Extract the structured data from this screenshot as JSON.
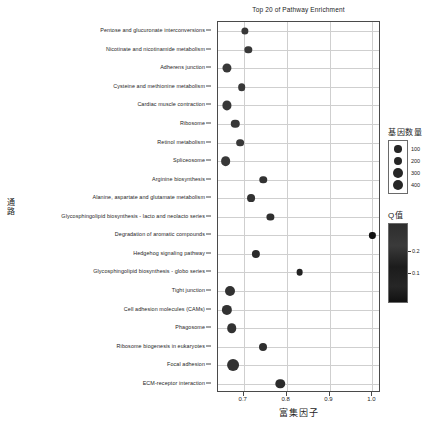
{
  "chart_data": {
    "type": "scatter",
    "title": "Top 20 of Pathway Enrichment",
    "xlabel": "富集因子",
    "ylabel": "通路",
    "xlim": [
      0.64,
      1.02
    ],
    "ylim": [
      0,
      21
    ],
    "grid": true,
    "xticks": [
      0.7,
      0.8,
      0.9,
      1.0
    ],
    "xtick_labels": [
      "0.7",
      "0.8",
      "0.9",
      "1.0"
    ],
    "categories": [
      "Pentose and glucuronate interconversions",
      "Nicotinate and nicotinamide metabolism",
      "Adherens junction",
      "Cysteine and methionine metabolism",
      "Cardiac muscle contraction",
      "Ribosome",
      "Retinol metabolism",
      "Spliceosome",
      "Arginine biosynthesis",
      "Alanine, aspartate and glutamate metabolism",
      "Glycosphingolipid biosynthesis - lacto and neolacto series",
      "Degradation of aromatic compounds",
      "Hedgehog signaling pathway",
      "Glycosphingolipid biosynthesis - globo series",
      "Tight junction",
      "Cell adhesion molecules (CAMs)",
      "Phagosome",
      "Ribosome biogenesis in eukaryotes",
      "Focal adhesion",
      "ECM-receptor interaction"
    ],
    "points": [
      {
        "pathway": "Pentose and glucuronate interconversions",
        "x": 0.702,
        "gene_number": 70,
        "qvalue": 0.02
      },
      {
        "pathway": "Nicotinate and nicotinamide metabolism",
        "x": 0.711,
        "gene_number": 75,
        "qvalue": 0.02
      },
      {
        "pathway": "Adherens junction",
        "x": 0.661,
        "gene_number": 150,
        "qvalue": 0.02
      },
      {
        "pathway": "Cysteine and methionine metabolism",
        "x": 0.695,
        "gene_number": 85,
        "qvalue": 0.02
      },
      {
        "pathway": "Cardiac muscle contraction",
        "x": 0.661,
        "gene_number": 155,
        "qvalue": 0.02
      },
      {
        "pathway": "Ribosome",
        "x": 0.68,
        "gene_number": 120,
        "qvalue": 0.02
      },
      {
        "pathway": "Retinol metabolism",
        "x": 0.692,
        "gene_number": 90,
        "qvalue": 0.02
      },
      {
        "pathway": "Spliceosome",
        "x": 0.658,
        "gene_number": 185,
        "qvalue": 0.02
      },
      {
        "pathway": "Arginine biosynthesis",
        "x": 0.745,
        "gene_number": 80,
        "qvalue": 0.05
      },
      {
        "pathway": "Alanine, aspartate and glutamate metabolism",
        "x": 0.718,
        "gene_number": 95,
        "qvalue": 0.05
      },
      {
        "pathway": "Glycosphingolipid biosynthesis - lacto and neolacto series",
        "x": 0.762,
        "gene_number": 70,
        "qvalue": 0.07
      },
      {
        "pathway": "Degradation of aromatic compounds",
        "x": 1.0,
        "gene_number": 40,
        "qvalue": 0.22
      },
      {
        "pathway": "Hedgehog signaling pathway",
        "x": 0.728,
        "gene_number": 110,
        "qvalue": 0.09
      },
      {
        "pathway": "Glycosphingolipid biosynthesis - globo series",
        "x": 0.83,
        "gene_number": 55,
        "qvalue": 0.13
      },
      {
        "pathway": "Tight junction",
        "x": 0.667,
        "gene_number": 200,
        "qvalue": 0.05
      },
      {
        "pathway": "Cell adhesion molecules (CAMs)",
        "x": 0.661,
        "gene_number": 215,
        "qvalue": 0.05
      },
      {
        "pathway": "Phagosome",
        "x": 0.672,
        "gene_number": 175,
        "qvalue": 0.05
      },
      {
        "pathway": "Ribosome biogenesis in eukaryotes",
        "x": 0.745,
        "gene_number": 100,
        "qvalue": 0.07
      },
      {
        "pathway": "Focal adhesion",
        "x": 0.675,
        "gene_number": 330,
        "qvalue": 0.05
      },
      {
        "pathway": "ECM-receptor interaction",
        "x": 0.785,
        "gene_number": 170,
        "qvalue": 0.09
      }
    ],
    "legends": {
      "size": {
        "title": "基因数量",
        "values": [
          100,
          200,
          300,
          400
        ],
        "labels": [
          "100",
          "200",
          "300",
          "400"
        ]
      },
      "color": {
        "title": "Q值",
        "ticks": [
          0.2,
          0.1
        ],
        "tick_labels": [
          "0.2",
          "0.1"
        ]
      }
    }
  }
}
